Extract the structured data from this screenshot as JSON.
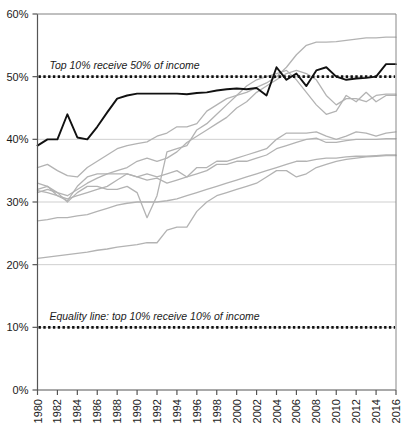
{
  "chart_data": {
    "type": "line",
    "title": "",
    "xlabel": "",
    "ylabel": "",
    "xlim": [
      1980,
      2016
    ],
    "ylim": [
      0,
      60
    ],
    "ytick_labels": [
      "0%",
      "10%",
      "20%",
      "30%",
      "40%",
      "50%",
      "60%"
    ],
    "ytick_values": [
      0,
      10,
      20,
      30,
      40,
      50,
      60
    ],
    "xtick_labels": [
      "1980",
      "1982",
      "1984",
      "1986",
      "1988",
      "1990",
      "1992",
      "1994",
      "1996",
      "1998",
      "2000",
      "2002",
      "2004",
      "2006",
      "2008",
      "2010",
      "2012",
      "2014",
      "2016"
    ],
    "xtick_values": [
      1980,
      1982,
      1984,
      1986,
      1988,
      1990,
      1992,
      1994,
      1996,
      1998,
      2000,
      2002,
      2004,
      2006,
      2008,
      2010,
      2012,
      2014,
      2016
    ],
    "grid": "horizontal",
    "legend_position": "none",
    "annotations": [
      {
        "text": "Top 10% receive 50% of income",
        "x": 1981.2,
        "y": 51.2,
        "style": "italic"
      },
      {
        "text": "Equality line: top 10% receive 10% of income",
        "x": 1981.2,
        "y": 11.2,
        "style": "italic"
      }
    ],
    "reference_lines": [
      {
        "name": "top-10-receive-50",
        "y": 50,
        "style": "dotted",
        "color": "#111111"
      },
      {
        "name": "equality-line",
        "y": 10,
        "style": "dotted",
        "color": "#111111"
      }
    ],
    "x": [
      1980,
      1981,
      1982,
      1983,
      1984,
      1985,
      1986,
      1987,
      1988,
      1989,
      1990,
      1991,
      1992,
      1993,
      1994,
      1995,
      1996,
      1997,
      1998,
      1999,
      2000,
      2001,
      2002,
      2003,
      2004,
      2005,
      2006,
      2007,
      2008,
      2009,
      2010,
      2011,
      2012,
      2013,
      2014,
      2015,
      2016
    ],
    "series": [
      {
        "name": "highlighted-series",
        "color": "#111111",
        "width": 1.9,
        "values": [
          39.0,
          40.0,
          40.0,
          44.0,
          40.3,
          40.0,
          42.0,
          44.3,
          46.5,
          47.0,
          47.3,
          47.3,
          47.3,
          47.3,
          47.3,
          47.2,
          47.4,
          47.5,
          47.8,
          48.0,
          48.1,
          48.0,
          48.2,
          47.0,
          51.5,
          49.5,
          50.5,
          48.5,
          51.0,
          51.5,
          50.0,
          49.5,
          49.7,
          49.8,
          50.0,
          52.0,
          52.0
        ]
      },
      {
        "name": "gray-series-1",
        "color": "#b3b3b3",
        "width": 1.3,
        "values": [
          35.5,
          36.0,
          35.0,
          34.2,
          34.0,
          35.5,
          36.5,
          37.5,
          38.5,
          39.0,
          39.3,
          39.6,
          40.5,
          41.0,
          42.0,
          42.0,
          42.5,
          44.5,
          45.5,
          46.5,
          47.0,
          47.5,
          48.3,
          49.0,
          50.0,
          51.5,
          53.5,
          55.0,
          55.5,
          55.5,
          55.6,
          55.8,
          56.0,
          56.2,
          56.2,
          56.3,
          56.3
        ]
      },
      {
        "name": "gray-series-2",
        "color": "#b3b3b3",
        "width": 1.3,
        "values": [
          32.0,
          32.5,
          31.0,
          30.2,
          32.5,
          34.0,
          34.5,
          34.5,
          35.0,
          35.5,
          36.5,
          37.0,
          36.5,
          37.0,
          38.0,
          39.5,
          40.5,
          41.5,
          42.5,
          43.5,
          45.0,
          46.0,
          47.5,
          48.5,
          49.5,
          50.5,
          51.0,
          50.5,
          49.5,
          47.0,
          45.5,
          46.5,
          46.5,
          46.0,
          47.0,
          47.2,
          47.2
        ]
      },
      {
        "name": "gray-series-3",
        "color": "#b3b3b3",
        "width": 1.3,
        "values": [
          31.5,
          32.0,
          31.5,
          31.0,
          32.0,
          33.0,
          33.8,
          34.5,
          34.5,
          34.5,
          34.0,
          34.5,
          34.0,
          34.5,
          35.0,
          34.0,
          35.5,
          35.5,
          36.5,
          36.5,
          37.0,
          37.5,
          38.0,
          38.5,
          40.0,
          41.0,
          41.0,
          41.0,
          41.2,
          40.5,
          40.0,
          40.5,
          41.2,
          41.0,
          40.5,
          41.0,
          41.2
        ]
      },
      {
        "name": "gray-series-4",
        "color": "#b3b3b3",
        "width": 1.3,
        "values": [
          31.8,
          31.5,
          31.0,
          30.5,
          31.0,
          31.5,
          32.0,
          32.5,
          33.5,
          34.5,
          34.0,
          33.5,
          33.8,
          33.0,
          33.5,
          34.0,
          34.5,
          35.0,
          36.0,
          36.0,
          36.5,
          36.5,
          37.0,
          37.5,
          38.5,
          39.0,
          39.5,
          40.0,
          40.2,
          39.5,
          39.5,
          39.8,
          40.0,
          40.0,
          40.0,
          40.1,
          40.1
        ]
      },
      {
        "name": "gray-series-5",
        "color": "#b3b3b3",
        "width": 1.3,
        "values": [
          27.0,
          27.2,
          27.5,
          27.5,
          27.8,
          28.0,
          28.5,
          29.0,
          29.5,
          29.8,
          30.0,
          30.0,
          30.0,
          30.2,
          30.5,
          31.0,
          31.5,
          32.0,
          32.5,
          33.0,
          33.5,
          34.0,
          34.5,
          35.0,
          35.5,
          36.0,
          36.5,
          36.5,
          36.8,
          37.0,
          37.0,
          37.2,
          37.3,
          37.3,
          37.4,
          37.5,
          37.5
        ]
      },
      {
        "name": "gray-series-6",
        "color": "#b3b3b3",
        "width": 1.3,
        "values": [
          21.0,
          21.2,
          21.4,
          21.6,
          21.8,
          22.0,
          22.3,
          22.5,
          22.8,
          23.0,
          23.2,
          23.5,
          23.5,
          25.5,
          26.0,
          26.0,
          28.5,
          30.0,
          31.0,
          31.5,
          32.0,
          32.5,
          33.0,
          34.0,
          35.0,
          35.0,
          34.0,
          34.5,
          35.5,
          36.0,
          36.5,
          36.8,
          37.0,
          37.2,
          37.3,
          37.4,
          37.4
        ]
      },
      {
        "name": "gray-series-7",
        "color": "#b3b3b3",
        "width": 1.3,
        "values": [
          33.0,
          32.5,
          31.5,
          30.0,
          31.5,
          32.5,
          32.5,
          32.0,
          32.0,
          32.5,
          31.5,
          27.5,
          31.0,
          38.0,
          38.5,
          39.0,
          41.5,
          42.5,
          44.0,
          45.5,
          47.0,
          48.5,
          49.5,
          50.0,
          50.5,
          51.0,
          49.5,
          47.5,
          45.5,
          44.0,
          44.5,
          47.0,
          46.0,
          47.5,
          46.0,
          47.0,
          47.0
        ]
      }
    ]
  }
}
